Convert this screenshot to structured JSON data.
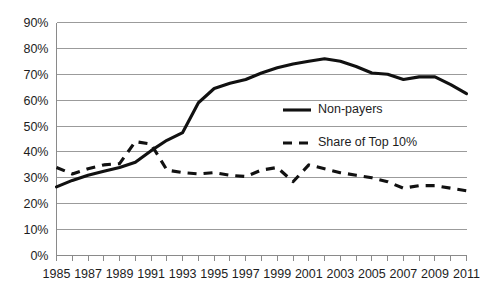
{
  "chart_data": {
    "type": "line",
    "title": "",
    "subtitle": "",
    "xlabel": "",
    "ylabel": "",
    "grid": "horizontal",
    "legend_position": "inside-right",
    "ylim": [
      0,
      90
    ],
    "ytick_step": 10,
    "ytick_labels": [
      "0%",
      "10%",
      "20%",
      "30%",
      "40%",
      "50%",
      "60%",
      "70%",
      "80%",
      "90%"
    ],
    "ytick_values": [
      0,
      10,
      20,
      30,
      40,
      50,
      60,
      70,
      80,
      90
    ],
    "xlim": [
      1985,
      2011
    ],
    "x": [
      1985,
      1986,
      1987,
      1988,
      1989,
      1990,
      1991,
      1992,
      1993,
      1994,
      1995,
      1996,
      1997,
      1998,
      1999,
      2000,
      2001,
      2002,
      2003,
      2004,
      2005,
      2006,
      2007,
      2008,
      2009,
      2010,
      2011
    ],
    "xtick_labels": [
      "1985",
      "1987",
      "1989",
      "1991",
      "1993",
      "1995",
      "1997",
      "1999",
      "2001",
      "2003",
      "2005",
      "2007",
      "2009",
      "2011"
    ],
    "xtick_values": [
      1985,
      1987,
      1989,
      1991,
      1993,
      1995,
      1997,
      1999,
      2001,
      2003,
      2005,
      2007,
      2009,
      2011
    ],
    "series": [
      {
        "name": "Non-payers",
        "style": "solid",
        "color": "#111111",
        "values": [
          26.5,
          29.0,
          31.0,
          32.5,
          34.0,
          36.0,
          40.5,
          44.5,
          47.5,
          59.0,
          64.5,
          66.5,
          68.0,
          70.5,
          72.5,
          74.0,
          75.0,
          76.0,
          75.0,
          73.0,
          70.5,
          70.0,
          68.0,
          69.0,
          69.0,
          66.0,
          62.5
        ]
      },
      {
        "name": "Share of Top 10%",
        "style": "dashed",
        "color": "#111111",
        "values": [
          34.0,
          31.5,
          33.5,
          35.0,
          35.5,
          44.0,
          43.0,
          33.0,
          32.0,
          31.5,
          32.0,
          31.0,
          30.5,
          33.0,
          34.0,
          28.5,
          35.0,
          33.5,
          32.0,
          31.0,
          30.0,
          28.5,
          26.0,
          27.0,
          27.0,
          26.0,
          25.0
        ]
      }
    ],
    "legend": [
      {
        "label": "Non-payers",
        "style": "solid"
      },
      {
        "label": "Share of Top 10%",
        "style": "dashed"
      }
    ]
  },
  "colors": {
    "background": "#ffffff",
    "line": "#111111",
    "gridline": "#9b9b9b",
    "axis": "#8a8a8a",
    "text": "#1d1d1d"
  }
}
